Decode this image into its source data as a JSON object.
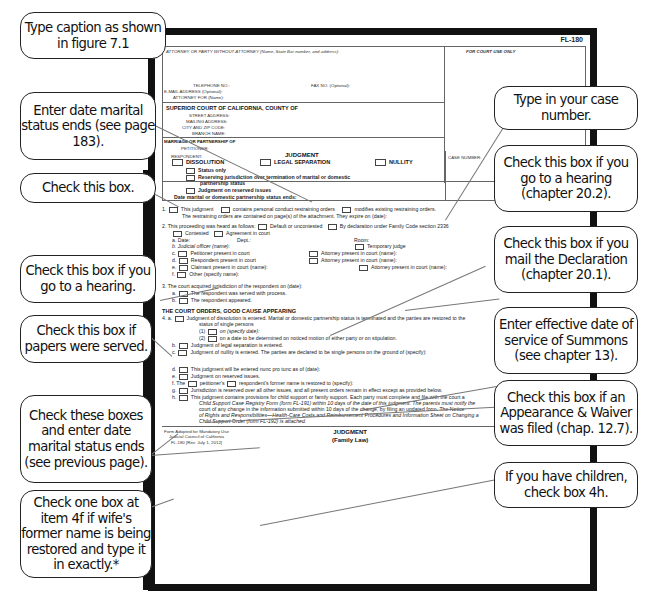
{
  "form": {
    "form_id": "FL-180",
    "header": {
      "attorney": "ATTORNEY OR PARTY WITHOUT ATTORNEY (Name, State Bar number, and address):",
      "court_use": "FOR COURT USE ONLY",
      "telephone": "TELEPHONE NO.:",
      "fax": "FAX NO. (Optional):",
      "email": "E-MAIL ADDRESS (Optional):",
      "attorney_for": "ATTORNEY FOR (Name):",
      "court": "SUPERIOR COURT OF CALIFORNIA, COUNTY OF",
      "street": "STREET ADDRESS:",
      "mailing": "MAILING ADDRESS:",
      "city": "CITY AND ZIP CODE:",
      "branch": "BRANCH NAME:",
      "marriage": "MARRIAGE OR PARTNERSHIP OF",
      "petitioner": "PETITIONER:",
      "respondent": "RESPONDENT:",
      "judgment_title": "JUDGMENT",
      "case_number": "CASE NUMBER:",
      "dissolution": "DISSOLUTION",
      "legal_separation": "LEGAL SEPARATION",
      "nullity": "NULLITY",
      "status_only": "Status only",
      "reserving": "Reserving jurisdiction over termination of marital or domestic",
      "reserving2": "partnership status",
      "reserved_issues": "Judgment on reserved issues",
      "status_ends": "Date marital or domestic partnership status ends:"
    },
    "item1": {
      "num": "1.",
      "a": "This judgment",
      "b": "contains personal conduct restraining orders",
      "c": "modifies existing restraining orders.",
      "line2": "The restraining orders are contained on page(s)        of the attachment. They expire on (date):"
    },
    "item2": {
      "num": "2.",
      "intro": "This proceeding was heard as follows:",
      "default": "Default or uncontested",
      "declaration": "By declaration under Family Code section 2336",
      "contested": "Contested",
      "agreement": "Agreement in court",
      "a": "a.  Date:",
      "dept": "Dept.:",
      "room": "Room:",
      "b": "b.  Judicial officer (name):",
      "temp_judge": "Temporary judge",
      "c": "Petitioner present in court",
      "c_att": "Attorney present in court (name):",
      "d": "Respondent present in court",
      "d_att": "Attorney present in court (name):",
      "e": "Claimant present in court (name):",
      "e_att": "Attorney present in court (name):",
      "f": "Other (specify name):"
    },
    "item3": {
      "num": "3.",
      "intro": "The court acquired jurisdiction of the respondent on (date):",
      "a": "The respondent was served with process.",
      "b": "The respondent appeared."
    },
    "orders_title": "THE COURT ORDERS, GOOD CAUSE APPEARING",
    "item4": {
      "num": "4.",
      "a": "Judgment of dissolution is entered. Marital or domestic partnership status is terminated and the parties are restored to the",
      "a2": "status of single persons",
      "a1": "on (specify date):",
      "a2b": "on a date to be determined on noticed motion of either party or on stipulation.",
      "b": "Judgment of legal separation is entered.",
      "c": "Judgment of nullity is entered. The parties are declared to be single persons on the ground of (specify):",
      "d": "This judgment will be entered nunc pro tunc as of (date):",
      "e": "Judgment on reserved issues.",
      "f_the": "The",
      "f_pet": "petitioner's",
      "f_resp": "respondent's   former name is restored to (specify):",
      "g": "Jurisdiction is reserved over all other issues, and all present orders remain in effect except as provided below.",
      "h1": "This judgment contains provisions for child support or family support. Each party must complete and file with the court a",
      "h2": "Child Support Case Registry Form (form FL-191) within 10 days of the date of this judgment. The parents must notify the",
      "h3": "court of any change in the information submitted within 10 days of the change, by filing an updated form. The Notice",
      "h4": "of Rights and Responsibilities—Health-Care Costs and Reimbursement Procedures and Information Sheet on Changing a",
      "h5": "Child Support Order (form FL-192) is attached."
    },
    "footer": {
      "left1": "Form Adopted for Mandatory Use",
      "left2": "Judicial Council of California",
      "left3": "FL-180 [Rev. July 1, 2012]",
      "center1": "JUDGMENT",
      "center2": "(Family Law)",
      "page": "Page 1 of 2",
      "right1": "Family Code, §§ 2024, 2340,",
      "right2": "2343, 2346",
      "right3": "www.courts.ca.gov"
    }
  },
  "callouts": {
    "left": [
      "Type caption as shown in figure 7.1",
      "Enter date marital status ends (see page 183).",
      "Check this box.",
      "Check this box if you go to a hearing.",
      "Check this box if papers were served.",
      "Check these boxes and enter date marital status ends (see previous page).",
      "Check one box at item 4f if wife's former name is being restored and type it in exactly.*"
    ],
    "right": [
      "Type in your case number.",
      "Check this box if you go to a hearing (chapter 20.2).",
      "Check this box if you mail the Declaration (chapter 20.1).",
      "Enter effective date of service of Summons (see chapter 13).",
      "Check this box if an Appearance & Waiver was filed (chap. 12.7).",
      "If you have children, check box 4h."
    ]
  }
}
